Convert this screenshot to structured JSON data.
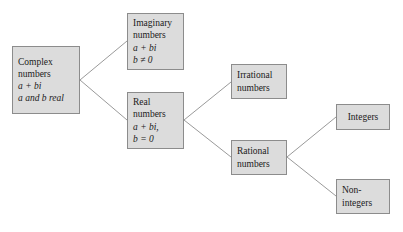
{
  "diagram": {
    "type": "tree-diagram",
    "background_color": "#ffffff",
    "node_fill_color": "#dcdcdc",
    "node_border_color": "#8c8c8c",
    "edge_color": "#9a9a9a",
    "nodes": {
      "complex": {
        "id": "complex",
        "lines": [
          "Complex",
          "numbers",
          "a + bi",
          "a and b real"
        ],
        "line1": "Complex",
        "line2": "numbers",
        "line3": "a + bi",
        "line4": "a and b real"
      },
      "imaginary": {
        "id": "imaginary",
        "lines": [
          "Imaginary",
          "numbers",
          "a + bi",
          "b ≠ 0"
        ],
        "line1": "Imaginary",
        "line2": "numbers",
        "line3": "a + bi",
        "line4": "b ≠ 0"
      },
      "real": {
        "id": "real",
        "lines": [
          "Real",
          "numbers",
          "a + bi,",
          "b = 0"
        ],
        "line1": "Real",
        "line2": "numbers",
        "line3": "a + bi,",
        "line4": "b = 0"
      },
      "irrational": {
        "id": "irrational",
        "lines": [
          "Irrational",
          "numbers"
        ],
        "line1": "Irrational",
        "line2": "numbers"
      },
      "rational": {
        "id": "rational",
        "lines": [
          "Rational",
          "numbers"
        ],
        "line1": "Rational",
        "line2": "numbers"
      },
      "integers": {
        "id": "integers",
        "lines": [
          "Integers"
        ],
        "line1": "Integers"
      },
      "nonintegers": {
        "id": "nonintegers",
        "lines": [
          "Non-",
          "integers"
        ],
        "line1": "Non-",
        "line2": "integers"
      }
    },
    "edges": [
      {
        "from": "complex",
        "to": "imaginary"
      },
      {
        "from": "complex",
        "to": "real"
      },
      {
        "from": "real",
        "to": "irrational"
      },
      {
        "from": "real",
        "to": "rational"
      },
      {
        "from": "rational",
        "to": "integers"
      },
      {
        "from": "rational",
        "to": "nonintegers"
      }
    ]
  }
}
